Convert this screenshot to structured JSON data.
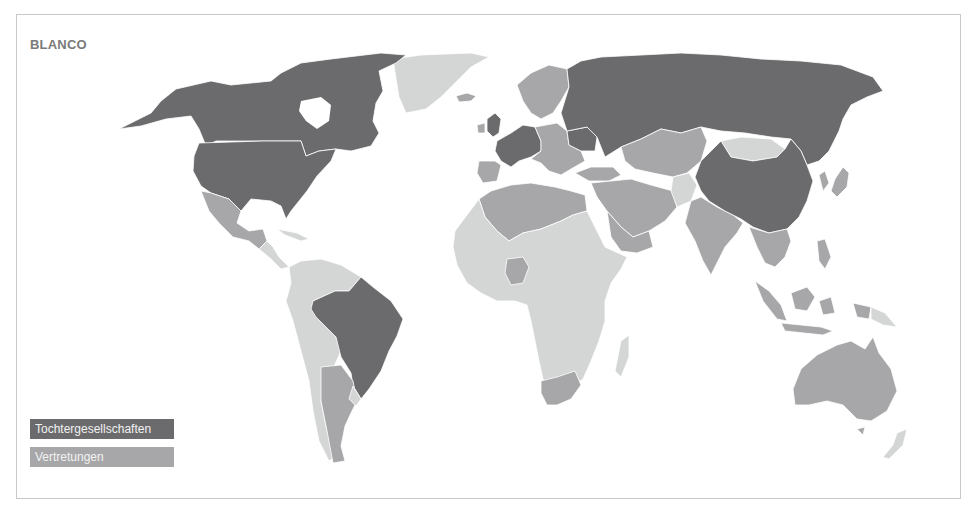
{
  "title": "BLANCO",
  "legend": [
    {
      "label": "Tochtergesellschaften",
      "color": "#6b6b6d"
    },
    {
      "label": "Vertretungen",
      "color": "#a7a7a9"
    }
  ],
  "colors": {
    "subsidiary": "#6b6b6d",
    "representation": "#a7a7a9",
    "none": "#d4d6d6",
    "border": "#c8c8c8",
    "title": "#7a7a7a"
  },
  "map": {
    "tochtergesellschaften": [
      "USA",
      "Canada",
      "Brazil",
      "Russia",
      "China",
      "United Kingdom",
      "France",
      "Germany",
      "Austria",
      "Switzerland",
      "Ukraine",
      "Denmark"
    ],
    "vertretungen": [
      "Mexico",
      "Argentina",
      "Iceland",
      "Norway",
      "Sweden",
      "Finland",
      "Spain",
      "Portugal",
      "Italy",
      "Poland",
      "Balkans",
      "Turkey",
      "Kazakhstan",
      "Central Asia",
      "Iran",
      "Saudi Arabia",
      "Middle East",
      "India",
      "Southeast Asia",
      "Indonesia",
      "Japan",
      "Korea",
      "Australia",
      "North Africa",
      "Nigeria",
      "South Africa"
    ]
  }
}
